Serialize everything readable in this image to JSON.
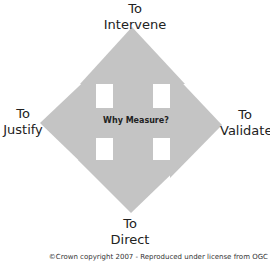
{
  "diagram": {
    "center_label": "Why Measure?",
    "arrows": [
      {
        "direction": "up",
        "line1": "To",
        "line2": "Intervene"
      },
      {
        "direction": "left",
        "line1": "To",
        "line2": "Justify"
      },
      {
        "direction": "right",
        "line1": "To",
        "line2": "Validate"
      },
      {
        "direction": "down",
        "line1": "To",
        "line2": "Direct"
      }
    ],
    "arrow_color": "#c4c4c4"
  },
  "footer": {
    "copyright": "©Crown copyright 2007 - Reproduced under license from OGC"
  }
}
